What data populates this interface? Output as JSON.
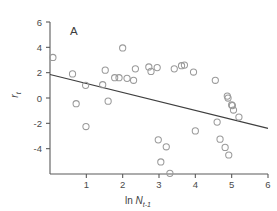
{
  "chart_data": {
    "type": "scatter",
    "title": "",
    "panel_label": "A",
    "xlabel": "ln N_t-1",
    "xlabel_parts": {
      "prefix": "ln ",
      "variable": "N",
      "subscript": "t-1"
    },
    "ylabel": "r_t",
    "ylabel_parts": {
      "variable": "r",
      "subscript": "t"
    },
    "xlim": [
      0,
      6
    ],
    "ylim": [
      -6,
      6
    ],
    "xticks": [
      0,
      1,
      2,
      3,
      4,
      5,
      6
    ],
    "xtick_labels": [
      "",
      "1",
      "2",
      "3",
      "4",
      "5",
      "6"
    ],
    "yticks": [
      -4,
      -2,
      0,
      2,
      4,
      6
    ],
    "ytick_labels": [
      "-4",
      "-2",
      "0",
      "2",
      "4",
      "6"
    ],
    "grid": false,
    "legend": false,
    "marker": "open-circle",
    "marker_color": "#9a9a9a",
    "line_color": "#3f3f3f",
    "points": [
      [
        0.08,
        3.2
      ],
      [
        0.62,
        1.9
      ],
      [
        0.72,
        -0.45
      ],
      [
        0.98,
        1.0
      ],
      [
        0.99,
        -2.25
      ],
      [
        1.45,
        1.05
      ],
      [
        1.52,
        2.2
      ],
      [
        1.6,
        -0.25
      ],
      [
        1.78,
        1.6
      ],
      [
        1.9,
        1.6
      ],
      [
        2.0,
        3.95
      ],
      [
        2.12,
        1.55
      ],
      [
        2.3,
        1.4
      ],
      [
        2.35,
        2.3
      ],
      [
        2.72,
        2.45
      ],
      [
        2.78,
        2.1
      ],
      [
        2.95,
        2.4
      ],
      [
        2.98,
        -3.3
      ],
      [
        3.05,
        -5.05
      ],
      [
        3.2,
        -3.85
      ],
      [
        3.3,
        -5.95
      ],
      [
        3.42,
        2.3
      ],
      [
        3.62,
        2.55
      ],
      [
        3.7,
        2.6
      ],
      [
        3.95,
        2.05
      ],
      [
        4.0,
        -2.6
      ],
      [
        4.55,
        1.4
      ],
      [
        4.6,
        -1.9
      ],
      [
        4.68,
        -3.25
      ],
      [
        4.82,
        -3.9
      ],
      [
        4.88,
        0.15
      ],
      [
        4.9,
        0.0
      ],
      [
        4.92,
        -4.5
      ],
      [
        5.0,
        -0.55
      ],
      [
        5.02,
        -0.6
      ],
      [
        5.05,
        -0.95
      ],
      [
        5.2,
        -1.5
      ]
    ],
    "fit_line": {
      "type": "linear",
      "x_start": 0,
      "y_start": 1.85,
      "x_end": 6,
      "y_end": -2.4
    }
  }
}
